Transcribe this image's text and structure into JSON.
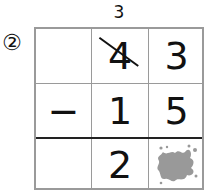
{
  "problem": {
    "number_label": "②",
    "borrow_mark": "3",
    "rows": [
      {
        "cells": [
          "",
          "4",
          "3"
        ],
        "note": "top number; tens digit 4 crossed out"
      },
      {
        "cells": [
          "−",
          "1",
          "5"
        ]
      },
      {
        "cells": [
          "",
          "2",
          "ink-blot"
        ]
      }
    ],
    "hidden_cell": "ink-blot-icon",
    "colors": {
      "grid": "#9a9a9a",
      "separator": "#222222",
      "blot": "#999999"
    }
  }
}
